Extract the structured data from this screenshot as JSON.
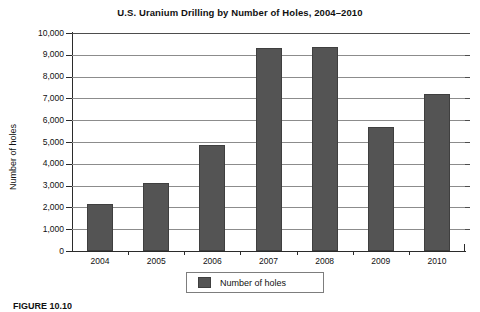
{
  "figure": {
    "caption": "FIGURE 10.10"
  },
  "chart_data": {
    "type": "bar",
    "title": "U.S. Uranium Drilling by Number of Holes, 2004–2010",
    "xlabel": "",
    "ylabel": "Number of holes",
    "categories": [
      "2004",
      "2005",
      "2006",
      "2007",
      "2008",
      "2009",
      "2010"
    ],
    "values": [
      2150,
      3120,
      4880,
      9330,
      9340,
      5700,
      7220
    ],
    "series": [
      {
        "name": "Number of holes",
        "values": [
          2150,
          3120,
          4880,
          9330,
          9340,
          5700,
          7220
        ],
        "color": "#545454"
      }
    ],
    "ylim": [
      0,
      10000
    ],
    "ytick_values": [
      0,
      1000,
      2000,
      3000,
      4000,
      5000,
      6000,
      7000,
      8000,
      9000,
      10000
    ],
    "ytick_labels": [
      "0",
      "1,000",
      "2,000",
      "3,000",
      "4,000",
      "5,000",
      "6,000",
      "7,000",
      "8,000",
      "9,000",
      "10,000"
    ],
    "grid": true,
    "grid_axis": "y",
    "legend": {
      "position": "bottom",
      "entries": [
        {
          "label": "Number of holes",
          "color": "#545454"
        }
      ]
    },
    "colors": {
      "bar_fill": "#545454",
      "bar_edge": "#3f3f3f",
      "gridline": "#8c8c8c",
      "axis": "#2b2b2b",
      "background": "#ffffff",
      "text": "#111111"
    }
  }
}
